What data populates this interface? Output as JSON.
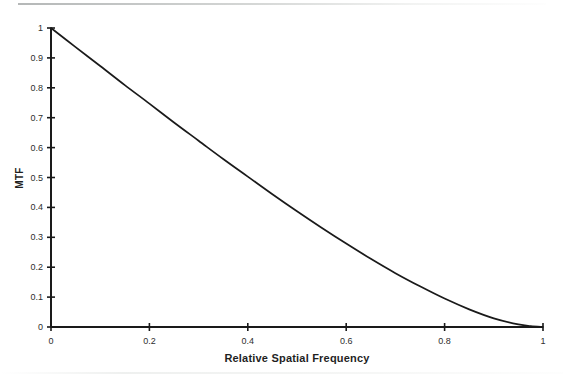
{
  "chart_data": {
    "type": "line",
    "title": "",
    "xlabel": "Relative Spatial Frequency",
    "ylabel": "MTF",
    "xlim": [
      0,
      1
    ],
    "ylim": [
      0,
      1
    ],
    "grid": false,
    "legend": null,
    "xticks": [
      "0",
      "0.2",
      "0.4",
      "0.6",
      "0.8",
      "1"
    ],
    "xtick_values": [
      0,
      0.2,
      0.4,
      0.6,
      0.8,
      1
    ],
    "yticks": [
      "0",
      "0.1",
      "0.2",
      "0.3",
      "0.4",
      "0.5",
      "0.6",
      "0.7",
      "0.8",
      "0.9",
      "1"
    ],
    "ytick_values": [
      0,
      0.1,
      0.2,
      0.3,
      0.4,
      0.5,
      0.6,
      0.7,
      0.8,
      0.9,
      1
    ],
    "series": [
      {
        "name": "Diffraction-limited MTF",
        "color": "#1a1a1a",
        "x": [
          0,
          0.05,
          0.1,
          0.15,
          0.2,
          0.25,
          0.3,
          0.35,
          0.4,
          0.45,
          0.5,
          0.55,
          0.6,
          0.65,
          0.7,
          0.75,
          0.8,
          0.85,
          0.9,
          0.95,
          0.975,
          1
        ],
        "y": [
          1.0,
          0.936,
          0.873,
          0.809,
          0.747,
          0.684,
          0.623,
          0.562,
          0.503,
          0.444,
          0.387,
          0.332,
          0.279,
          0.228,
          0.18,
          0.136,
          0.095,
          0.059,
          0.029,
          0.0086,
          0.003,
          0.0
        ]
      }
    ]
  },
  "axes": {
    "x_title": "Relative Spatial Frequency",
    "y_title": "MTF"
  }
}
